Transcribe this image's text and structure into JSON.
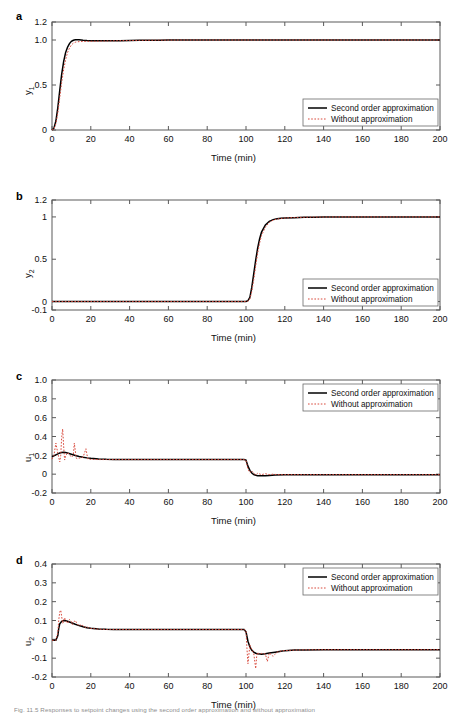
{
  "figure": {
    "caption": "Fig. 11.5  Responses to setpoint changes using the second order approximation and without approximation",
    "xlabel": "Time (min)",
    "legend": {
      "series_solid": "Second order approximation",
      "series_dotted": "Without approximation"
    },
    "colors": {
      "solid": "#000000",
      "dotted": "#d94a3d",
      "axis": "#5a5a5a"
    }
  },
  "chart_data": [
    {
      "type": "line",
      "panel": "a",
      "title": "",
      "xlabel": "Time (min)",
      "ylabel": "y_1",
      "ylabel_display": "y1",
      "xlim": [
        0,
        200
      ],
      "ylim": [
        0,
        1.2
      ],
      "xticks": [
        0,
        20,
        40,
        60,
        80,
        100,
        120,
        140,
        160,
        180,
        200
      ],
      "xticklabels": [
        "0",
        "20",
        "40",
        "60",
        "80",
        "100",
        "120",
        "140",
        "160",
        "180",
        "200"
      ],
      "yticks": [
        0,
        0.5,
        1.0,
        1.2
      ],
      "yticklabels": [
        "0",
        "0.5",
        "1.0",
        "1.2"
      ],
      "grid": false,
      "legend_position": "lower right",
      "series": [
        {
          "name": "Second order approximation",
          "style": "solid",
          "color": "#000000",
          "x": [
            0,
            1,
            2,
            3,
            4,
            5,
            6,
            7,
            8,
            9,
            10,
            11,
            12,
            13,
            14,
            15,
            16,
            18,
            20,
            25,
            30,
            35,
            40,
            45,
            50,
            55,
            60,
            65,
            70,
            80,
            90,
            100,
            110,
            120,
            140,
            160,
            180,
            200
          ],
          "y": [
            0,
            0.02,
            0.1,
            0.25,
            0.44,
            0.62,
            0.76,
            0.86,
            0.92,
            0.96,
            0.985,
            0.997,
            1.002,
            1.003,
            1.002,
            1.0,
            0.998,
            0.995,
            0.993,
            0.991,
            0.992,
            0.993,
            0.995,
            0.996,
            0.997,
            0.998,
            1.0,
            1.0,
            1.0,
            1.0,
            1.0,
            1.0,
            1.0,
            1.0,
            1.0,
            1.0,
            1.0,
            1.0
          ]
        },
        {
          "name": "Without approximation",
          "style": "dotted",
          "color": "#d94a3d",
          "x": [
            0,
            1,
            2,
            3,
            4,
            5,
            6,
            7,
            8,
            9,
            10,
            11,
            12,
            13,
            14,
            15,
            16,
            18,
            20,
            25,
            30,
            35,
            40,
            45,
            50,
            55,
            60,
            70,
            80,
            100,
            120,
            140,
            160,
            180,
            200
          ],
          "y": [
            0,
            0.01,
            0.07,
            0.19,
            0.36,
            0.53,
            0.67,
            0.78,
            0.86,
            0.91,
            0.945,
            0.965,
            0.975,
            0.98,
            0.982,
            0.983,
            0.984,
            0.985,
            0.986,
            0.988,
            0.99,
            0.992,
            0.994,
            0.996,
            0.997,
            0.998,
            0.999,
            1.0,
            1.0,
            1.0,
            1.0,
            1.0,
            1.0,
            1.0,
            1.0
          ]
        }
      ]
    },
    {
      "type": "line",
      "panel": "b",
      "title": "",
      "xlabel": "Time (min)",
      "ylabel": "y_2",
      "ylabel_display": "y2",
      "xlim": [
        0,
        200
      ],
      "ylim": [
        -0.1,
        1.2
      ],
      "xticks": [
        0,
        20,
        40,
        60,
        80,
        100,
        120,
        140,
        160,
        180,
        200
      ],
      "xticklabels": [
        "0",
        "20",
        "40",
        "60",
        "80",
        "100",
        "120",
        "140",
        "160",
        "180",
        "200"
      ],
      "yticks": [
        -0.1,
        0,
        0.5,
        1,
        1.2
      ],
      "yticklabels": [
        "-0.1",
        "0",
        "0.5",
        "1",
        "1.2"
      ],
      "grid": false,
      "legend_position": "lower right",
      "series": [
        {
          "name": "Second order approximation",
          "style": "solid",
          "color": "#000000",
          "x": [
            0,
            20,
            40,
            60,
            80,
            95,
            100,
            101,
            102,
            103,
            104,
            105,
            106,
            107,
            108,
            110,
            112,
            114,
            116,
            118,
            120,
            125,
            130,
            135,
            140,
            150,
            160,
            180,
            200
          ],
          "y": [
            0,
            0,
            0,
            0,
            0,
            0,
            0,
            0.01,
            0.05,
            0.17,
            0.33,
            0.49,
            0.63,
            0.74,
            0.82,
            0.905,
            0.948,
            0.968,
            0.978,
            0.983,
            0.986,
            0.991,
            0.995,
            0.997,
            0.999,
            1.0,
            1.0,
            1.0,
            1.0
          ]
        },
        {
          "name": "Without approximation",
          "style": "dotted",
          "color": "#d94a3d",
          "x": [
            0,
            20,
            40,
            60,
            80,
            95,
            100,
            101,
            102,
            103,
            104,
            105,
            106,
            107,
            108,
            110,
            112,
            114,
            116,
            118,
            120,
            125,
            130,
            135,
            140,
            150,
            160,
            180,
            200
          ],
          "y": [
            0,
            0,
            0,
            0,
            0,
            0,
            0,
            0.005,
            0.03,
            0.12,
            0.26,
            0.42,
            0.57,
            0.69,
            0.78,
            0.88,
            0.935,
            0.962,
            0.975,
            0.982,
            0.987,
            0.993,
            0.996,
            0.998,
            0.999,
            1.0,
            1.0,
            1.0,
            1.0
          ]
        }
      ]
    },
    {
      "type": "line",
      "panel": "c",
      "title": "",
      "xlabel": "Time (min)",
      "ylabel": "u_1",
      "ylabel_display": "u1",
      "xlim": [
        0,
        200
      ],
      "ylim": [
        -0.2,
        1.0
      ],
      "xticks": [
        0,
        20,
        40,
        60,
        80,
        100,
        120,
        140,
        160,
        180,
        200
      ],
      "xticklabels": [
        "0",
        "20",
        "40",
        "60",
        "80",
        "100",
        "120",
        "140",
        "160",
        "180",
        "200"
      ],
      "yticks": [
        -0.2,
        0,
        0.2,
        0.4,
        0.6,
        0.8,
        1.0
      ],
      "yticklabels": [
        "-0.2",
        "0",
        "0.2",
        "0.4",
        "0.6",
        "0.8",
        "1.0"
      ],
      "grid": false,
      "legend_position": "upper right",
      "series": [
        {
          "name": "Second order approximation",
          "style": "solid",
          "color": "#000000",
          "x": [
            0,
            1,
            2,
            3,
            4,
            5,
            6,
            7,
            8,
            10,
            12,
            14,
            16,
            18,
            20,
            24,
            28,
            32,
            40,
            60,
            80,
            99,
            100,
            101,
            102,
            103,
            104,
            105,
            106,
            108,
            110,
            112,
            115,
            120,
            130,
            140,
            160,
            180,
            200
          ],
          "y": [
            0.185,
            0.195,
            0.205,
            0.215,
            0.224,
            0.23,
            0.232,
            0.23,
            0.225,
            0.212,
            0.199,
            0.188,
            0.18,
            0.173,
            0.168,
            0.162,
            0.158,
            0.156,
            0.155,
            0.155,
            0.155,
            0.155,
            0.15,
            0.085,
            0.04,
            0.012,
            -0.004,
            -0.012,
            -0.016,
            -0.018,
            -0.016,
            -0.013,
            -0.01,
            -0.007,
            -0.005,
            -0.005,
            -0.005,
            -0.005,
            -0.005
          ]
        },
        {
          "name": "Without approximation",
          "style": "dotted",
          "color": "#d94a3d",
          "x": [
            0,
            1,
            2,
            3,
            4,
            4.5,
            5,
            5.5,
            6,
            6.5,
            7,
            8,
            9,
            10,
            11,
            11.5,
            12,
            12.5,
            13,
            14,
            16,
            17.5,
            18,
            18.5,
            19,
            20,
            22,
            24,
            26,
            28,
            30,
            35,
            40,
            60,
            80,
            99,
            100,
            101,
            102,
            103,
            104,
            105,
            106,
            108,
            110,
            112,
            114,
            116,
            118,
            120,
            130,
            140,
            160,
            180,
            200
          ],
          "y": [
            0.16,
            0.2,
            0.33,
            0.22,
            0.13,
            0.2,
            0.4,
            0.48,
            0.3,
            0.15,
            0.19,
            0.23,
            0.21,
            0.18,
            0.2,
            0.33,
            0.25,
            0.17,
            0.165,
            0.17,
            0.18,
            0.27,
            0.21,
            0.16,
            0.158,
            0.157,
            0.156,
            0.155,
            0.155,
            0.155,
            0.155,
            0.155,
            0.155,
            0.155,
            0.155,
            0.155,
            0.145,
            0.055,
            0.015,
            0.035,
            0.01,
            -0.01,
            0.01,
            -0.005,
            0.005,
            -0.005,
            0.0,
            -0.005,
            -0.005,
            -0.005,
            -0.005,
            -0.005,
            -0.005,
            -0.005,
            -0.005
          ]
        }
      ]
    },
    {
      "type": "line",
      "panel": "d",
      "title": "",
      "xlabel": "Time (min)",
      "ylabel": "u_2",
      "ylabel_display": "u2",
      "xlim": [
        0,
        200
      ],
      "ylim": [
        -0.2,
        0.4
      ],
      "xticks": [
        0,
        20,
        40,
        60,
        80,
        100,
        120,
        140,
        160,
        180,
        200
      ],
      "xticklabels": [
        "0",
        "20",
        "40",
        "60",
        "80",
        "100",
        "120",
        "140",
        "160",
        "180",
        "200"
      ],
      "yticks": [
        -0.2,
        -0.1,
        0,
        0.1,
        0.2,
        0.3,
        0.4
      ],
      "yticklabels": [
        "-0.2",
        "-0.1",
        "0",
        "0.1",
        "0.2",
        "0.3",
        "0.4"
      ],
      "grid": false,
      "legend_position": "upper right",
      "series": [
        {
          "name": "Second order approximation",
          "style": "solid",
          "color": "#000000",
          "x": [
            0,
            2,
            3,
            3.5,
            4,
            5,
            6,
            7,
            8,
            9,
            10,
            12,
            14,
            16,
            18,
            20,
            24,
            28,
            32,
            40,
            60,
            80,
            99,
            100,
            101,
            102,
            103,
            104,
            105,
            106,
            108,
            110,
            112,
            115,
            118,
            120,
            125,
            130,
            140,
            160,
            180,
            200
          ],
          "y": [
            -0.005,
            -0.005,
            0.02,
            0.06,
            0.082,
            0.096,
            0.1,
            0.099,
            0.096,
            0.092,
            0.088,
            0.08,
            0.073,
            0.067,
            0.062,
            0.059,
            0.055,
            0.053,
            0.052,
            0.052,
            0.052,
            0.052,
            0.052,
            0.04,
            -0.01,
            -0.04,
            -0.058,
            -0.068,
            -0.074,
            -0.077,
            -0.079,
            -0.077,
            -0.073,
            -0.068,
            -0.063,
            -0.06,
            -0.057,
            -0.056,
            -0.055,
            -0.055,
            -0.055,
            -0.055
          ]
        },
        {
          "name": "Without approximation",
          "style": "dotted",
          "color": "#d94a3d",
          "x": [
            0,
            2,
            3,
            3.5,
            4,
            4.5,
            5,
            5.5,
            6,
            6.5,
            7,
            8,
            9,
            10,
            10.5,
            11,
            12,
            13,
            14,
            15,
            16,
            17,
            18,
            19,
            20,
            22,
            24,
            26,
            28,
            30,
            35,
            40,
            60,
            80,
            99,
            100,
            100.5,
            101,
            102,
            103,
            104,
            105,
            105.5,
            106,
            107,
            108,
            110,
            111,
            112,
            114,
            116,
            118,
            120,
            125,
            130,
            140,
            160,
            180,
            200
          ],
          "y": [
            -0.005,
            -0.005,
            0.035,
            0.105,
            0.145,
            0.155,
            0.12,
            0.085,
            0.095,
            0.115,
            0.1,
            0.085,
            0.105,
            0.095,
            0.078,
            0.09,
            0.1,
            0.082,
            0.07,
            0.078,
            0.072,
            0.063,
            0.068,
            0.06,
            0.058,
            0.056,
            0.054,
            0.053,
            0.052,
            0.052,
            0.052,
            0.052,
            0.052,
            0.052,
            0.052,
            0.045,
            -0.05,
            -0.13,
            -0.03,
            -0.055,
            -0.075,
            -0.155,
            -0.09,
            -0.07,
            -0.08,
            -0.075,
            -0.078,
            -0.118,
            -0.072,
            -0.09,
            -0.068,
            -0.062,
            -0.06,
            -0.057,
            -0.056,
            -0.055,
            -0.055,
            -0.055,
            -0.055
          ]
        }
      ]
    }
  ]
}
